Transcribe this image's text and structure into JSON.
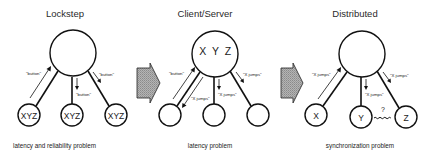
{
  "panels": [
    {
      "title": "Lockstep",
      "caption": "latency and reliability problem",
      "center_label": "",
      "nodes": [
        "XYZ",
        "XYZ",
        "XYZ"
      ],
      "messages": {
        "left_up": "\"button\"",
        "middle_down": "\"button\"",
        "right_down": "\"button\""
      }
    },
    {
      "title": "Client/Server",
      "caption": "latency problem",
      "center_label": "X Y Z",
      "nodes": [
        "",
        "",
        ""
      ],
      "messages": {
        "left_up": "\"button\"",
        "left_down": "\"X jumps\"",
        "middle_down": "\"X jumps\"",
        "right_down": "\"X jumps\""
      }
    },
    {
      "title": "Distributed",
      "caption": "synchronization problem",
      "center_label": "",
      "nodes": [
        "X",
        "Y",
        "Z"
      ],
      "messages": {
        "left_up": "\"X jumps\"",
        "middle_down": "\"X jumps\"",
        "right_down": "\"X jumps\"",
        "sync_question": "?"
      }
    }
  ],
  "transition_arrows": [
    {
      "name": "lockstep-to-client-server"
    },
    {
      "name": "client-server-to-distributed"
    }
  ],
  "colors": {
    "stroke": "#111111",
    "arrow_fill": "#a9a9a9",
    "background": "#ffffff"
  }
}
